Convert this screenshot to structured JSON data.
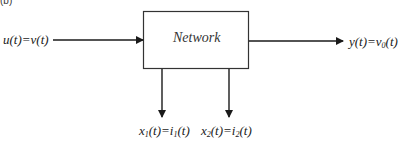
{
  "panel_label": "(b)",
  "block": {
    "label": "Network"
  },
  "input": {
    "lhs": "u(t)",
    "eq": "=",
    "rhs": "v(t)"
  },
  "output": {
    "lhs": "y(t)",
    "eq": "=",
    "rhs_base": "v",
    "rhs_sub": "0",
    "rhs_tail": "(t)"
  },
  "states": [
    {
      "lhs_base": "x",
      "lhs_sub": "1",
      "lhs_tail": "(t)",
      "eq": "=",
      "rhs_base": "i",
      "rhs_sub": "1",
      "rhs_tail": "(t)"
    },
    {
      "lhs_base": "x",
      "lhs_sub": "2",
      "lhs_tail": "(t)",
      "eq": "=",
      "rhs_base": "i",
      "rhs_sub": "2",
      "rhs_tail": "(t)"
    }
  ],
  "colors": {
    "stroke": "#1a1a1a"
  }
}
